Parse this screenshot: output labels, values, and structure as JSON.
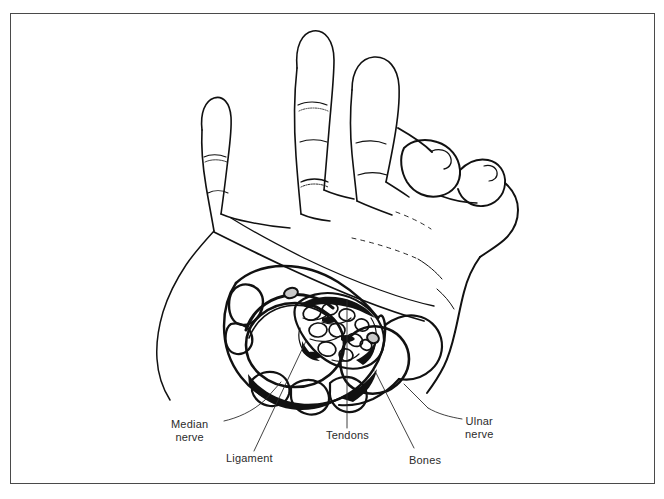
{
  "figure": {
    "style": "black-and-white line drawing",
    "border_color": "#4a4a4a",
    "ink_color": "#111111",
    "background_color": "#ffffff",
    "label_color": "#2b2b2b"
  },
  "labels": [
    {
      "id": "median-nerve",
      "line1": "Median",
      "line2": "nerve"
    },
    {
      "id": "ligament",
      "line1": "Ligament",
      "line2": ""
    },
    {
      "id": "tendons",
      "line1": "Tendons",
      "line2": ""
    },
    {
      "id": "bones",
      "line1": "Bones",
      "line2": ""
    },
    {
      "id": "ulnar-nerve",
      "line1": "Ulnar",
      "line2": "nerve"
    }
  ]
}
